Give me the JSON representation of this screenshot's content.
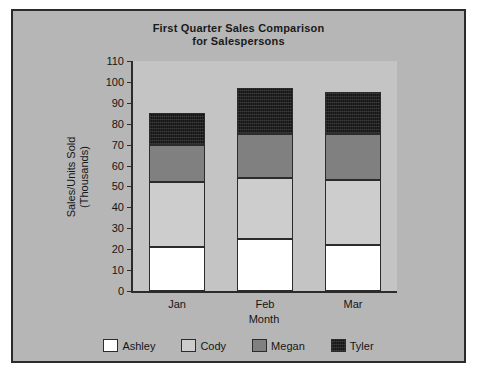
{
  "chart_data": {
    "type": "bar",
    "subtype": "stacked-column",
    "title": "First Quarter Sales Comparison for Salespersons",
    "title_lines": [
      "First Quarter Sales Comparison",
      "for Salespersons"
    ],
    "xlabel": "Month",
    "ylabel": "Sales/Units Sold (Thousands)",
    "ylabel_lines": [
      "Sales/Units Sold",
      "(Thousands)"
    ],
    "categories": [
      "Jan",
      "Feb",
      "Mar"
    ],
    "ylim": [
      0,
      110
    ],
    "ytick_step": 10,
    "yticks": [
      0,
      10,
      20,
      30,
      40,
      50,
      60,
      70,
      80,
      90,
      100,
      110
    ],
    "ytick_labels": [
      "0",
      "10",
      "20",
      "30",
      "40",
      "50",
      "60",
      "70",
      "80",
      "90",
      "100",
      "110"
    ],
    "grid": false,
    "legend_position": "bottom",
    "series": [
      {
        "name": "Ashley",
        "color": "#ffffff",
        "values": [
          21,
          25,
          22
        ]
      },
      {
        "name": "Cody",
        "color": "#cdcdcd",
        "values": [
          31,
          29,
          31
        ]
      },
      {
        "name": "Megan",
        "color": "#808080",
        "values": [
          18,
          21,
          22
        ]
      },
      {
        "name": "Tyler",
        "color": "#161616",
        "values": [
          15,
          22,
          20
        ]
      }
    ],
    "totals": [
      85,
      97,
      95
    ]
  },
  "figure": {
    "background": "#b6b6b6",
    "plot_background": "#c4c4c4",
    "border_color": "#2b2b2b"
  }
}
